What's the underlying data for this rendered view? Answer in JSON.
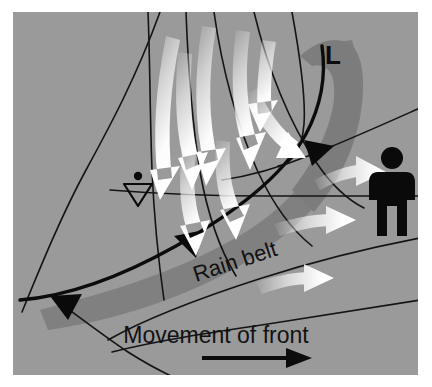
{
  "figure": {
    "panel": {
      "x": 13,
      "y": 12,
      "width": 405,
      "height": 363
    },
    "background_color": "#ffffff",
    "panel_color": "#9a9a9a"
  },
  "colors": {
    "panel_gray": "#9a9a9a",
    "rain_belt_gray": "#7e7e7e",
    "rain_belt_gray_dark": "#767676",
    "isobar_black": "#111111",
    "front_black": "#0c0c0c",
    "arrow_white": "#ffffff",
    "arrow_fade": "#bdbdbd",
    "figure_black": "#0a0a0a",
    "text_black": "#121212"
  },
  "labels": {
    "low_pressure": "L",
    "rain_belt": "Rain belt",
    "movement_of_front": "Movement of front"
  },
  "symbols": [
    {
      "name": "rain-station-symbol",
      "description": "dot above hollow inverted triangle",
      "x": 138,
      "y": 188
    },
    {
      "name": "observer-figure",
      "description": "black human silhouette standing on isobar",
      "x": 392,
      "y": 190
    }
  ],
  "fronts": [
    {
      "name": "cold-front-main",
      "type": "cold",
      "pip_shape": "filled-triangle",
      "pip_count": 3,
      "description": "Front line sweeping from lower-left triple point up and around the low centre"
    }
  ],
  "front_pips": [
    {
      "x": 68,
      "y": 298,
      "rotation": 186
    },
    {
      "x": 191,
      "y": 240,
      "rotation": 197
    },
    {
      "x": 320,
      "y": 152,
      "rotation": 243
    }
  ],
  "isobars": {
    "count": 9,
    "description": "Thin black curved isobar lines spiralling into the low centre"
  },
  "flow_arrows": {
    "count": 9,
    "description": "White gradient arrows showing cyclonic airflow spiralling toward the low centre and outflow to the right"
  },
  "movement_arrow": {
    "name": "movement-arrow",
    "direction": "right",
    "x1": 202,
    "y1": 358,
    "x2": 300,
    "y2": 358
  },
  "chart_data": {
    "type": "diagram",
    "annotations": [
      "L",
      "Rain belt",
      "Movement of front"
    ],
    "legend": [],
    "xlabel": "",
    "ylabel": ""
  }
}
